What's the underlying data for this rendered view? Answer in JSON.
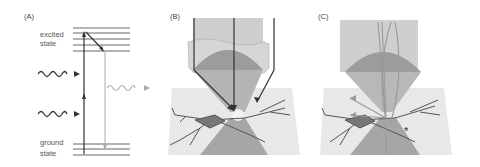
{
  "panels": {
    "a": {
      "label": "(A)",
      "excited_label_1": "excited",
      "excited_label_2": "state",
      "ground_label_1": "ground",
      "ground_label_2": "state"
    },
    "b": {
      "label": "(B)"
    },
    "c": {
      "label": "(C)",
      "marker": "*"
    }
  },
  "colors": {
    "line_dark": "#333333",
    "line_light": "#999999",
    "objective_fill": "#c8c8c8",
    "lens_fill": "#9a9a9a",
    "plane_fill": "#e6e6e6",
    "cone_fill": "#a8a8a8",
    "neuron_fill": "#7a7a7a"
  }
}
